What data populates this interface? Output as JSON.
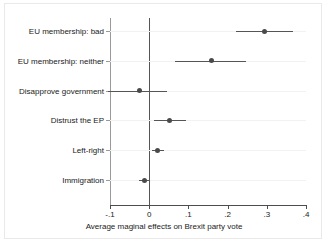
{
  "chart_data": {
    "type": "scatter",
    "subtype": "coefficient-plot-with-error-bars",
    "title": "",
    "xlabel": "Average maginal effects on Brexit party vote",
    "ylabel": "",
    "xlim": [
      -0.1,
      0.4
    ],
    "xticks": [
      -0.1,
      0,
      0.1,
      0.2,
      0.3,
      0.4
    ],
    "xticklabels": [
      "-.1",
      "0",
      ".1",
      ".2",
      ".3",
      ".4"
    ],
    "grid": false,
    "legend": null,
    "reference_line": 0,
    "categories": [
      "EU membership: bad",
      "EU membership: neither",
      "Disapprove government",
      "Distrust the EP",
      "Left-right",
      "Immigration"
    ],
    "values": [
      0.295,
      0.158,
      -0.026,
      0.053,
      0.021,
      -0.013
    ],
    "ci_low": [
      0.221,
      0.066,
      -0.105,
      0.013,
      0.008,
      -0.027
    ],
    "ci_high": [
      0.368,
      0.247,
      0.045,
      0.095,
      0.039,
      0.002
    ],
    "points": [
      {
        "label": "EU membership: bad",
        "estimate": 0.295,
        "ci_low": 0.221,
        "ci_high": 0.368
      },
      {
        "label": "EU membership: neither",
        "estimate": 0.158,
        "ci_low": 0.066,
        "ci_high": 0.247
      },
      {
        "label": "Disapprove government",
        "estimate": -0.026,
        "ci_low": -0.105,
        "ci_high": 0.045
      },
      {
        "label": "Distrust the EP",
        "estimate": 0.053,
        "ci_low": 0.013,
        "ci_high": 0.095
      },
      {
        "label": "Left-right",
        "estimate": 0.021,
        "ci_low": 0.008,
        "ci_high": 0.039
      },
      {
        "label": "Immigration",
        "estimate": -0.013,
        "ci_low": -0.027,
        "ci_high": 0.002
      }
    ],
    "colors": {
      "marker": "#4a4a4a",
      "ci": "#555555",
      "axis": "#4d4d4d",
      "reference_line": "#555555",
      "background": "#ffffff"
    }
  }
}
